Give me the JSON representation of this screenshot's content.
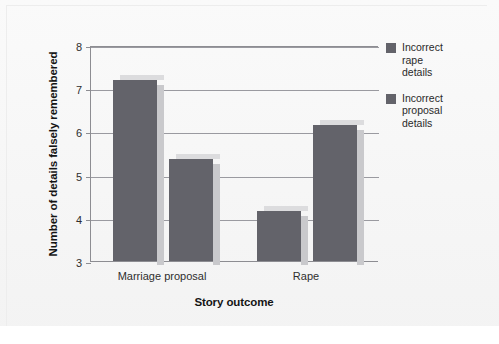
{
  "chart_data": {
    "type": "bar",
    "title": "",
    "xlabel": "Story outcome",
    "ylabel": "Number of details falsely remembered",
    "categories": [
      "Marriage proposal",
      "Rape"
    ],
    "series": [
      {
        "name": "Incorrect rape details",
        "values": [
          7.2,
          4.15
        ],
        "color": "#63636a"
      },
      {
        "name": "Incorrect proposal details",
        "values": [
          5.35,
          6.15
        ],
        "color": "#63636a"
      }
    ],
    "ylim": [
      3,
      8
    ],
    "yticks": [
      3,
      4,
      5,
      6,
      7,
      8
    ],
    "ytick_labels": [
      "3",
      "4",
      "5",
      "6",
      "7",
      "8"
    ],
    "grid": true,
    "legend_position": "right"
  },
  "legend": {
    "items": [
      {
        "label": "Incorrect\nrape\ndetails"
      },
      {
        "label": "Incorrect\nproposal\ndetails"
      }
    ]
  },
  "axes": {
    "y_title": "Number of details falsely remembered",
    "x_title": "Story outcome",
    "y_ticks": [
      "8",
      "7",
      "6",
      "5",
      "4",
      "3"
    ],
    "x_ticks": [
      "Marriage proposal",
      "Rape"
    ]
  }
}
